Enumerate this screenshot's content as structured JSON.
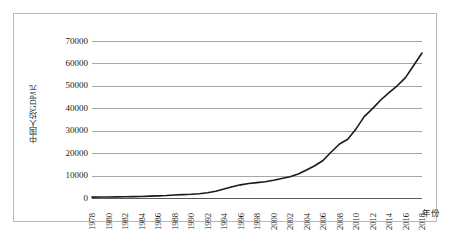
{
  "chart_data": {
    "type": "line",
    "title": "",
    "xlabel": "年份",
    "ylabel": "中国人均GDP/元",
    "ylim": [
      0,
      70000
    ],
    "ytick_values": [
      0,
      10000,
      20000,
      30000,
      40000,
      50000,
      60000,
      70000
    ],
    "ytick_labels": [
      "0",
      "10000",
      "20000",
      "30000",
      "40000",
      "50000",
      "60000",
      "70000"
    ],
    "xlim": [
      1978,
      2018
    ],
    "xtick_labels": [
      "1978",
      "1980",
      "1982",
      "1984",
      "1986",
      "1988",
      "1990",
      "1992",
      "1994",
      "1996",
      "1998",
      "2000",
      "2002",
      "2004",
      "2006",
      "2008",
      "2010",
      "2012",
      "2014",
      "2016",
      "2018"
    ],
    "grid": true,
    "legend": false,
    "line_color": "#1a1a1a",
    "gridline_color": "#a6a6a6",
    "series": [
      {
        "name": "中国人均GDP",
        "x": [
          1978,
          1979,
          1980,
          1981,
          1982,
          1983,
          1984,
          1985,
          1986,
          1987,
          1988,
          1989,
          1990,
          1991,
          1992,
          1993,
          1994,
          1995,
          1996,
          1997,
          1998,
          1999,
          2000,
          2001,
          2002,
          2003,
          2004,
          2005,
          2006,
          2007,
          2008,
          2009,
          2010,
          2011,
          2012,
          2013,
          2014,
          2015,
          2016,
          2017,
          2018
        ],
        "values": [
          385,
          423,
          468,
          497,
          533,
          593,
          695,
          858,
          963,
          1112,
          1366,
          1519,
          1644,
          1893,
          2311,
          3009,
          4010,
          5034,
          5868,
          6497,
          6834,
          7249,
          7942,
          8717,
          9506,
          10666,
          12487,
          14368,
          16738,
          20494,
          24100,
          26180,
          30808,
          36302,
          39874,
          43684,
          47005,
          50028,
          53680,
          59201,
          64644
        ]
      }
    ]
  }
}
